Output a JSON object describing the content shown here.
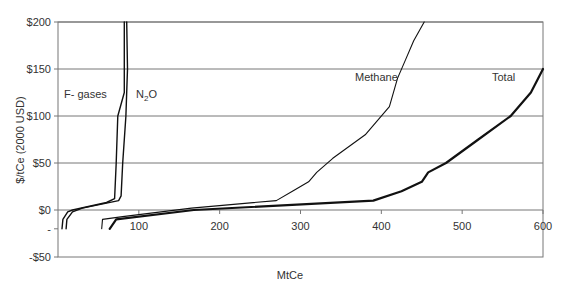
{
  "chart_data": {
    "type": "line",
    "title": "",
    "xlabel": "MtCe",
    "ylabel": "$/tCe (2000 USD)",
    "xlim": [
      0,
      600
    ],
    "ylim": [
      -50,
      200
    ],
    "grid": "horizontal",
    "x_ticks": [
      100,
      200,
      300,
      400,
      500,
      600
    ],
    "x_tick_labels": [
      "100",
      "200",
      "300",
      "400",
      "500",
      "600"
    ],
    "y_ticks": [
      200,
      150,
      100,
      50,
      0,
      -20,
      -50
    ],
    "y_tick_labels": [
      "$200",
      "$150",
      "$100",
      "$50",
      "$0",
      "-",
      "-$50"
    ],
    "legend": "inline labels",
    "series": [
      {
        "name": "F- gases",
        "label_pos": [
          32,
          140
        ],
        "stroke_width": 1.4,
        "points": [
          [
            5,
            -20
          ],
          [
            6,
            -10
          ],
          [
            12,
            -2
          ],
          [
            18,
            0
          ],
          [
            60,
            8
          ],
          [
            70,
            12
          ],
          [
            72,
            50
          ],
          [
            74,
            100
          ],
          [
            82,
            125
          ],
          [
            82,
            150
          ],
          [
            82,
            200
          ]
        ]
      },
      {
        "name": "N2O",
        "label_pos": [
          90,
          140
        ],
        "stroke_width": 1.4,
        "points": [
          [
            10,
            -20
          ],
          [
            11,
            -10
          ],
          [
            18,
            -2
          ],
          [
            30,
            2
          ],
          [
            75,
            10
          ],
          [
            78,
            15
          ],
          [
            80,
            50
          ],
          [
            84,
            100
          ],
          [
            86,
            150
          ],
          [
            85,
            200
          ]
        ]
      },
      {
        "name": "Methane",
        "label_pos": [
          345,
          140
        ],
        "stroke_width": 1.1,
        "points": [
          [
            54,
            -20
          ],
          [
            55,
            -10
          ],
          [
            80,
            -7
          ],
          [
            165,
            2
          ],
          [
            270,
            10
          ],
          [
            290,
            20
          ],
          [
            310,
            30
          ],
          [
            320,
            40
          ],
          [
            340,
            55
          ],
          [
            380,
            80
          ],
          [
            410,
            110
          ],
          [
            420,
            140
          ],
          [
            430,
            160
          ],
          [
            440,
            180
          ],
          [
            453,
            200
          ]
        ]
      },
      {
        "name": "Total",
        "label_pos": [
          540,
          140
        ],
        "stroke_width": 2.2,
        "points": [
          [
            64,
            -20
          ],
          [
            72,
            -10
          ],
          [
            168,
            0
          ],
          [
            390,
            10
          ],
          [
            425,
            20
          ],
          [
            450,
            30
          ],
          [
            458,
            40
          ],
          [
            480,
            50
          ],
          [
            520,
            75
          ],
          [
            560,
            100
          ],
          [
            585,
            125
          ],
          [
            600,
            150
          ]
        ]
      }
    ]
  },
  "labels": {
    "y_axis_title": "$/tCe (2000 USD)",
    "x_axis_title": "MtCe",
    "fgases": "F- gases",
    "n2o_main": "N",
    "n2o_sub": "2",
    "n2o_end": "O",
    "methane": "Methane",
    "total": "Total"
  }
}
